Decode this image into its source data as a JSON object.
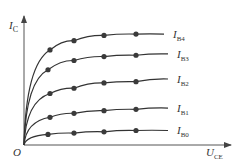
{
  "chart_data": {
    "type": "line",
    "title": "",
    "xlabel": "U_CE",
    "ylabel": "I_C",
    "origin_label": "O",
    "grid": false,
    "legend_position": "right-inline",
    "note": "Qualitative transistor output characteristic curves; no numeric ticks shown. Coordinates are normalized (x: 0-1 of axis length, y: 0-1 of axis height).",
    "series": [
      {
        "name": "I_B4",
        "label_main": "I",
        "label_sub": "B4",
        "points": [
          [
            0,
            0
          ],
          [
            0.13,
            0.72
          ],
          [
            0.25,
            0.79
          ],
          [
            0.4,
            0.83
          ],
          [
            0.56,
            0.84
          ],
          [
            0.7,
            0.84
          ]
        ]
      },
      {
        "name": "I_B3",
        "label_main": "I",
        "label_sub": "B3",
        "points": [
          [
            0,
            0
          ],
          [
            0.12,
            0.57
          ],
          [
            0.25,
            0.64
          ],
          [
            0.4,
            0.67
          ],
          [
            0.56,
            0.68
          ],
          [
            0.72,
            0.69
          ]
        ]
      },
      {
        "name": "I_B2",
        "label_main": "I",
        "label_sub": "B2",
        "points": [
          [
            0,
            0
          ],
          [
            0.13,
            0.39
          ],
          [
            0.25,
            0.43
          ],
          [
            0.4,
            0.47
          ],
          [
            0.56,
            0.48
          ],
          [
            0.72,
            0.5
          ]
        ]
      },
      {
        "name": "I_B1",
        "label_main": "I",
        "label_sub": "B1",
        "points": [
          [
            0,
            0
          ],
          [
            0.13,
            0.21
          ],
          [
            0.25,
            0.24
          ],
          [
            0.4,
            0.26
          ],
          [
            0.56,
            0.27
          ],
          [
            0.72,
            0.28
          ]
        ]
      },
      {
        "name": "I_B0",
        "label_main": "I",
        "label_sub": "B0",
        "points": [
          [
            0,
            0
          ],
          [
            0.12,
            0.08
          ],
          [
            0.25,
            0.09
          ],
          [
            0.4,
            0.1
          ],
          [
            0.56,
            0.11
          ],
          [
            0.72,
            0.11
          ]
        ]
      }
    ],
    "marker_indices": [
      1,
      2,
      3,
      4
    ]
  },
  "axes": {
    "y_label_main": "I",
    "y_label_sub": "C",
    "x_label_main": "U",
    "x_label_sub": "CE",
    "origin": "O"
  },
  "colors": {
    "axis": "#555555",
    "curve": "#333333",
    "marker": "#3a3a3a",
    "text": "#333333"
  }
}
